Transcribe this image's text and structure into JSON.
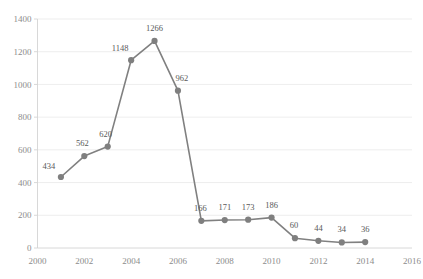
{
  "chart_data": {
    "type": "line",
    "title": "",
    "subtitle": "",
    "xlabel": "",
    "ylabel": "",
    "x": [
      2001,
      2002,
      2003,
      2004,
      2005,
      2006,
      2007,
      2008,
      2009,
      2010,
      2011,
      2012,
      2013,
      2014
    ],
    "values": [
      434,
      562,
      620,
      1148,
      1266,
      962,
      166,
      171,
      173,
      186,
      60,
      44,
      34,
      36
    ],
    "point_labels": [
      "434",
      "562",
      "620",
      "1148",
      "1266",
      "962",
      "166",
      "171",
      "173",
      "186",
      "60",
      "44",
      "34",
      "36"
    ],
    "series": [
      {
        "name": "",
        "values": [
          434,
          562,
          620,
          1148,
          1266,
          962,
          166,
          171,
          173,
          186,
          60,
          44,
          34,
          36
        ]
      }
    ],
    "xlim": [
      2000,
      2016
    ],
    "ylim": [
      0,
      1400
    ],
    "x_ticks": [
      2000,
      2002,
      2004,
      2006,
      2008,
      2010,
      2012,
      2014,
      2016
    ],
    "x_tick_labels": [
      "2000",
      "2002",
      "2004",
      "2006",
      "2008",
      "2010",
      "2012",
      "2014",
      "2016"
    ],
    "y_ticks": [
      0,
      200,
      400,
      600,
      800,
      1000,
      1200,
      1400
    ],
    "y_tick_labels": [
      "0",
      "200",
      "400",
      "600",
      "800",
      "1000",
      "1200",
      "1400"
    ],
    "grid": true,
    "grid_axis": "y",
    "legend": false,
    "legend_position": "none",
    "colors": {
      "line": "#808080",
      "marker": "#7f7f7f",
      "gridline": "#e8e8e8",
      "axis": "#d4d4d4",
      "tick_text": "#8c8c8c",
      "label_text": "#595959",
      "background": "#ffffff"
    }
  }
}
